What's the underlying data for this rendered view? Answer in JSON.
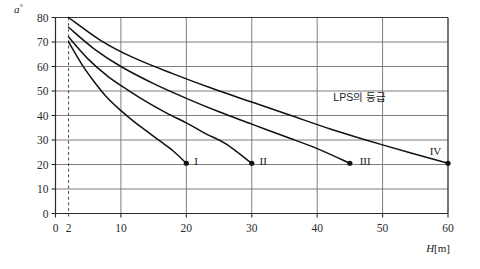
{
  "chart_data": {
    "type": "line",
    "title": "",
    "xlabel": "H[m]",
    "ylabel": "a°",
    "xlim": [
      0,
      60
    ],
    "ylim": [
      0,
      80
    ],
    "grid": true,
    "legend_position": "inline-end-labels",
    "x_ticks": [
      0,
      2,
      10,
      20,
      30,
      40,
      50,
      60
    ],
    "x_tick_labels": [
      "0",
      "2",
      "10",
      "20",
      "30",
      "40",
      "50",
      "60"
    ],
    "y_ticks": [
      0,
      10,
      20,
      30,
      40,
      50,
      60,
      70,
      80
    ],
    "y_tick_labels": [
      "0",
      "10",
      "20",
      "30",
      "40",
      "50",
      "60",
      "70",
      "80"
    ],
    "x_gridlines": [
      10,
      20,
      30,
      40,
      50,
      60
    ],
    "y_gridlines": [
      10,
      20,
      30,
      40,
      50,
      60,
      70,
      80
    ],
    "reference_line_x": 2,
    "annotations": [
      {
        "text": "LPS의 등급",
        "x": 46.5,
        "y": 46
      }
    ],
    "series": [
      {
        "name": "I",
        "label": "I",
        "end_label_x": 21.2,
        "end_label_y": 21.5,
        "points": [
          {
            "x": 2,
            "y": 70
          },
          {
            "x": 4,
            "y": 61
          },
          {
            "x": 6,
            "y": 53.5
          },
          {
            "x": 8,
            "y": 47
          },
          {
            "x": 10,
            "y": 42
          },
          {
            "x": 12,
            "y": 37.5
          },
          {
            "x": 14,
            "y": 33.5
          },
          {
            "x": 16,
            "y": 29.5
          },
          {
            "x": 18,
            "y": 25.5
          },
          {
            "x": 20,
            "y": 20.5
          }
        ]
      },
      {
        "name": "II",
        "label": "II",
        "end_label_x": 31.2,
        "end_label_y": 21.5,
        "points": [
          {
            "x": 2,
            "y": 72
          },
          {
            "x": 5,
            "y": 63
          },
          {
            "x": 8,
            "y": 56
          },
          {
            "x": 11,
            "y": 50.5
          },
          {
            "x": 14,
            "y": 45.5
          },
          {
            "x": 17,
            "y": 41
          },
          {
            "x": 20,
            "y": 37
          },
          {
            "x": 23,
            "y": 32.5
          },
          {
            "x": 26,
            "y": 28.5
          },
          {
            "x": 30,
            "y": 20.5
          }
        ]
      },
      {
        "name": "III",
        "label": "III",
        "end_label_x": 46.5,
        "end_label_y": 21.5,
        "points": [
          {
            "x": 2,
            "y": 76
          },
          {
            "x": 6,
            "y": 67
          },
          {
            "x": 10,
            "y": 60
          },
          {
            "x": 15,
            "y": 53
          },
          {
            "x": 20,
            "y": 47
          },
          {
            "x": 25,
            "y": 41.5
          },
          {
            "x": 30,
            "y": 36.5
          },
          {
            "x": 35,
            "y": 31.5
          },
          {
            "x": 40,
            "y": 26.5
          },
          {
            "x": 45,
            "y": 20.5
          }
        ]
      },
      {
        "name": "IV",
        "label": "IV",
        "end_label_x": 57.2,
        "end_label_y": 25.5,
        "points": [
          {
            "x": 2,
            "y": 80
          },
          {
            "x": 7,
            "y": 70.5
          },
          {
            "x": 12,
            "y": 63.5
          },
          {
            "x": 18,
            "y": 57
          },
          {
            "x": 24,
            "y": 51
          },
          {
            "x": 30,
            "y": 45.5
          },
          {
            "x": 36,
            "y": 40
          },
          {
            "x": 42,
            "y": 34.5
          },
          {
            "x": 50,
            "y": 28
          },
          {
            "x": 60,
            "y": 20.5
          }
        ]
      }
    ]
  },
  "colors": {
    "curve": "#111111",
    "grid": "#6f6f6f",
    "frame": "#3a3a3a",
    "text": "#1a1a1a",
    "background": "#ffffff"
  }
}
